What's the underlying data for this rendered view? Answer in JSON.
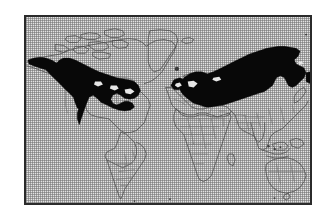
{
  "figure": {
    "kind": "distribution-range-map",
    "title": "",
    "caption": "",
    "frame": {
      "border_color": "#2b2b2b",
      "border_width_px": 2,
      "x": 24,
      "y": 15,
      "width": 288,
      "height": 190
    },
    "page_background": "#ffffff"
  },
  "map": {
    "projection_hint": "equirectangular world map",
    "ground_tone": "#e3e3e3",
    "dither": "1px checkerboard halftone",
    "coastline_color": "#4a4a4a",
    "country_border_color": "#6a6a6a",
    "range_color": "#080808",
    "landmasses": [
      "North America",
      "Greenland",
      "Iceland",
      "South America",
      "Europe",
      "Africa",
      "Asia",
      "Southeast Asian archipelago",
      "Australia",
      "New Zealand",
      "Japan",
      "British Isles",
      "Madagascar"
    ],
    "shaded_ranges": [
      {
        "name": "North American range",
        "description": "Black shaded band across Alaska, central and eastern Canada and the northern United States, reaching the Great Lakes and the northeast Atlantic coast."
      },
      {
        "name": "Eurasian range",
        "description": "Black shaded band across Scandinavia, northern and eastern Europe, Russia and Siberia, extending east to Kamchatka and the Sea of Okhotsk."
      }
    ],
    "legend": {
      "visible": false,
      "entries": [
        {
          "swatch": "#080808",
          "label": "Breeding / resident range"
        }
      ]
    },
    "labels": [],
    "scale_bar": {
      "visible": false,
      "text": ""
    },
    "north_arrow": {
      "visible": false
    }
  },
  "chart_data": {
    "type": "map",
    "title": "",
    "xlabel": "",
    "ylabel": "",
    "series": [
      {
        "name": "Shaded range",
        "color": "#080808",
        "regions": [
          "North America",
          "Eurasia"
        ]
      }
    ],
    "categories": [
      "North America",
      "Eurasia"
    ],
    "values": [
      1,
      1
    ]
  }
}
